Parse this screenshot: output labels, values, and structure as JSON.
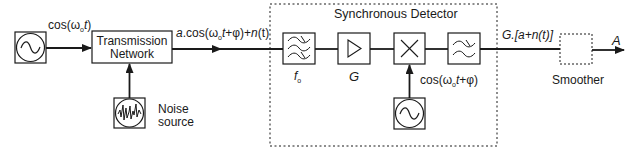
{
  "diagram": {
    "title": "Synchronous Detector",
    "colors": {
      "stroke": "#1a1a1a",
      "background": "#ffffff"
    },
    "blocks": [
      {
        "id": "source-oscillator",
        "icon": "sine-wave-icon"
      },
      {
        "id": "transmission-network",
        "label_line1": "Transmission",
        "label_line2": "Network"
      },
      {
        "id": "noise-source",
        "icon": "noise-icon",
        "label_line1": "Noise",
        "label_line2": "source"
      },
      {
        "id": "bandpass-filter",
        "icon": "bandpass-filter-icon",
        "label": "f",
        "label_sub": "o"
      },
      {
        "id": "amplifier",
        "icon": "amplifier-triangle-icon",
        "label": "G"
      },
      {
        "id": "multiplier",
        "icon": "multiply-icon"
      },
      {
        "id": "lowpass-filter",
        "icon": "lowpass-filter-icon"
      },
      {
        "id": "reference-oscillator",
        "icon": "sine-wave-icon"
      },
      {
        "id": "smoother",
        "label": "Smoother"
      }
    ],
    "signals": {
      "input": {
        "pre": "cos(ω",
        "sub": "o",
        "post_it": "t",
        "close": ")"
      },
      "received": {
        "a": "a",
        "mid": ".cos(ω",
        "sub": "o",
        "t": "t",
        "phi": "+φ)+",
        "n": "n",
        "nt": "(t)"
      },
      "reference": {
        "pre": "cos(ω",
        "sub": "o",
        "t": "t",
        "post": "+φ)"
      },
      "detector_out": {
        "text": "G.[a+n(t)]"
      },
      "output": {
        "text": "A"
      }
    }
  }
}
